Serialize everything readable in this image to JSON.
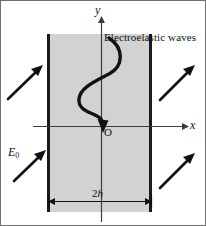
{
  "figure": {
    "caption_text": "Electroelastic waves",
    "axis_labels": {
      "y": "y",
      "x": "x",
      "origin": "O"
    },
    "field_label": {
      "symbol": "E",
      "subscript": "0"
    },
    "thickness_label": {
      "number": "2",
      "symbol": "h"
    },
    "colors": {
      "slab_fill": "#d2d2d2",
      "slab_edge": "#1a1a1a",
      "axis": "#3d3d3d",
      "wave": "#111111",
      "arrow": "#111111",
      "border": "#6e6e6e",
      "background": "#ffffff"
    },
    "geometry": {
      "slab_left_x": 47,
      "slab_right_x": 152,
      "slab_top_y": 34,
      "slab_bottom_y": 212,
      "y_axis_x": 101,
      "x_axis_y": 126,
      "x_axis_left": 33,
      "x_axis_right": 186,
      "y_axis_top": 18,
      "y_axis_bottom": 222,
      "dimension_line_y": 201
    },
    "incident_arrows": [
      {
        "name": "incident-arrow-upper-left",
        "x1": 8,
        "y1": 99,
        "x2": 42,
        "y2": 66
      },
      {
        "name": "incident-arrow-lower-left",
        "x1": 14,
        "y1": 181,
        "x2": 45,
        "y2": 151
      },
      {
        "name": "transmitted-arrow-upper-right",
        "x1": 160,
        "y1": 100,
        "x2": 196,
        "y2": 66
      },
      {
        "name": "transmitted-arrow-lower-right",
        "x1": 160,
        "y1": 188,
        "x2": 196,
        "y2": 155
      }
    ],
    "wave": {
      "description": "vertical sinusoidal wave with arrowhead at origin",
      "amplitude": 22,
      "cycles": 2.25,
      "direction": "downward"
    }
  }
}
